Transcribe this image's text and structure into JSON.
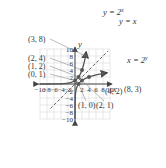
{
  "chart_data": {
    "type": "line",
    "title": "",
    "xlabel": "x",
    "ylabel": "y",
    "xlim": [
      -10,
      10
    ],
    "ylim": [
      -10,
      10
    ],
    "grid": true,
    "x_ticks": [
      "-10",
      "-8",
      "-6",
      "-4",
      "-2",
      "2",
      "4",
      "6",
      "8",
      "10"
    ],
    "y_ticks": [
      "10",
      "8",
      "6",
      "4",
      "2",
      "-2",
      "-4",
      "-6",
      "-8",
      "-10"
    ],
    "series": [
      {
        "name": "y = 2^x",
        "label": "y = 2",
        "label_sup": "x",
        "points": [
          [
            0,
            1
          ],
          [
            1,
            2
          ],
          [
            2,
            4
          ],
          [
            3,
            8
          ]
        ],
        "point_labels": [
          "(0, 1)",
          "(1, 2)",
          "(2, 4)",
          "(3, 8)"
        ],
        "color": "#555555"
      },
      {
        "name": "y = x",
        "label": "y = x",
        "style": "dashed",
        "color": "#555555"
      },
      {
        "name": "x = 2^y",
        "label": "x = 2",
        "label_sup": "y",
        "points": [
          [
            1,
            0
          ],
          [
            2,
            1
          ],
          [
            4,
            2
          ],
          [
            8,
            3
          ]
        ],
        "point_labels": [
          "(1, 0)",
          "(2, 1)",
          "(4, 2)",
          "(8, 3)"
        ],
        "color": "#555555"
      }
    ]
  }
}
